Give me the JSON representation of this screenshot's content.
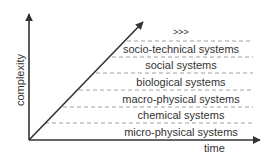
{
  "diagram": {
    "axes": {
      "x_label": "time",
      "y_label": "complexity"
    },
    "levels": [
      {
        "label": ">>>",
        "y": 33
      },
      {
        "label": "socio-technical systems",
        "y": 49
      },
      {
        "label": "social systems",
        "y": 65
      },
      {
        "label": "biological systems",
        "y": 82
      },
      {
        "label": "macro-physical systems",
        "y": 99
      },
      {
        "label": "chemical systems",
        "y": 115
      },
      {
        "label": "micro-physical systems",
        "y": 132
      }
    ],
    "colors": {
      "line": "#333333",
      "dash": "#888888",
      "text": "#333333"
    }
  }
}
